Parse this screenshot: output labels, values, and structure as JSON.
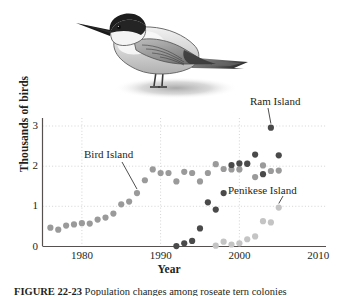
{
  "figure": {
    "caption_number": "FIGURE 22-23",
    "caption_text": "Population changes among roseate tern colonies",
    "illustration": "tern-bird-illustration"
  },
  "chart_data": {
    "type": "scatter",
    "title": "",
    "xlabel": "Year",
    "ylabel": "Thousands of birds",
    "xlim": [
      1975,
      2011
    ],
    "ylim": [
      0,
      3.2
    ],
    "xticks": [
      1980,
      1990,
      2000,
      2010
    ],
    "yticks": [
      0,
      1,
      2,
      3
    ],
    "grid": "dotted",
    "legend_position": "inline-annotations",
    "series": [
      {
        "name": "Bird Island",
        "color": "#9a9a9a",
        "points": [
          {
            "x": 1976,
            "y": 0.47
          },
          {
            "x": 1977,
            "y": 0.42
          },
          {
            "x": 1978,
            "y": 0.52
          },
          {
            "x": 1979,
            "y": 0.55
          },
          {
            "x": 1980,
            "y": 0.58
          },
          {
            "x": 1981,
            "y": 0.57
          },
          {
            "x": 1982,
            "y": 0.67
          },
          {
            "x": 1983,
            "y": 0.72
          },
          {
            "x": 1984,
            "y": 0.82
          },
          {
            "x": 1985,
            "y": 1.05
          },
          {
            "x": 1986,
            "y": 1.12
          },
          {
            "x": 1987,
            "y": 1.33
          },
          {
            "x": 1988,
            "y": 1.65
          },
          {
            "x": 1989,
            "y": 1.92
          },
          {
            "x": 1990,
            "y": 1.83
          },
          {
            "x": 1991,
            "y": 1.83
          },
          {
            "x": 1992,
            "y": 1.62
          },
          {
            "x": 1993,
            "y": 1.86
          },
          {
            "x": 1994,
            "y": 1.83
          },
          {
            "x": 1995,
            "y": 1.62
          },
          {
            "x": 1996,
            "y": 1.83
          },
          {
            "x": 1997,
            "y": 2.05
          },
          {
            "x": 1998,
            "y": 1.93
          },
          {
            "x": 1999,
            "y": 1.92
          },
          {
            "x": 2000,
            "y": 1.92
          },
          {
            "x": 2001,
            "y": 2.07
          },
          {
            "x": 2002,
            "y": 1.73
          },
          {
            "x": 2003,
            "y": 2.02
          },
          {
            "x": 2004,
            "y": 1.88
          },
          {
            "x": 2005,
            "y": 1.89
          }
        ]
      },
      {
        "name": "Ram Island",
        "color": "#4a4a4a",
        "points": [
          {
            "x": 1992,
            "y": 0.01
          },
          {
            "x": 1993,
            "y": 0.08
          },
          {
            "x": 1994,
            "y": 0.14
          },
          {
            "x": 1995,
            "y": 0.45
          },
          {
            "x": 1996,
            "y": 1.1
          },
          {
            "x": 1997,
            "y": 0.92
          },
          {
            "x": 1998,
            "y": 1.33
          },
          {
            "x": 1999,
            "y": 2.03
          },
          {
            "x": 2000,
            "y": 2.07
          },
          {
            "x": 2001,
            "y": 2.06
          },
          {
            "x": 2002,
            "y": 2.29
          },
          {
            "x": 2003,
            "y": 1.8
          },
          {
            "x": 2004,
            "y": 2.96
          },
          {
            "x": 2005,
            "y": 2.27
          }
        ]
      },
      {
        "name": "Penikese Island",
        "color": "#c4c4c4",
        "points": [
          {
            "x": 1997,
            "y": 0.02
          },
          {
            "x": 1998,
            "y": 0.12
          },
          {
            "x": 1999,
            "y": 0.05
          },
          {
            "x": 2000,
            "y": 0.08
          },
          {
            "x": 2001,
            "y": 0.18
          },
          {
            "x": 2002,
            "y": 0.25
          },
          {
            "x": 2003,
            "y": 0.63
          },
          {
            "x": 2004,
            "y": 0.6
          },
          {
            "x": 2005,
            "y": 0.97
          }
        ]
      }
    ],
    "annotations": [
      {
        "label": "Bird Island",
        "points_to_x": 1987,
        "points_to_y": 1.33
      },
      {
        "label": "Ram Island",
        "points_to_x": 2004,
        "points_to_y": 2.96
      },
      {
        "label": "Penikese Island",
        "points_to_x": 2005,
        "points_to_y": 0.97
      }
    ]
  },
  "axis": {
    "x_tick_labels": [
      "1980",
      "1990",
      "2000",
      "2010"
    ],
    "y_tick_labels": [
      "0",
      "1",
      "2",
      "3"
    ],
    "x_title": "Year",
    "y_title": "Thousands of birds"
  },
  "annotations": {
    "bird_island": "Bird Island",
    "ram_island": "Ram Island",
    "penikese_island": "Penikese Island"
  }
}
